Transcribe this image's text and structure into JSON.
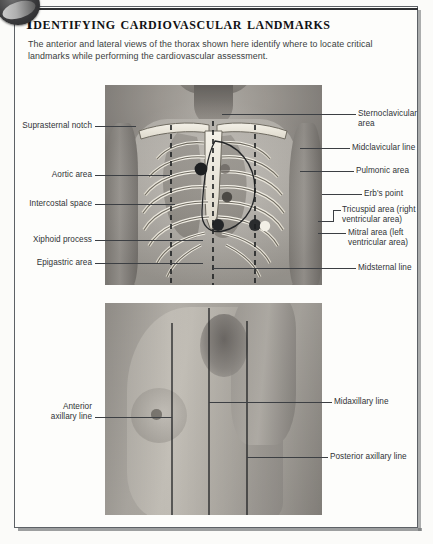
{
  "page": {
    "title": "Identifying cardiovascular landmarks",
    "intro": "The anterior and lateral views of the thorax shown here identify where to locate critical landmarks while performing the cardiovascular assessment.",
    "badge_icon": "dark-circular-badge-icon"
  },
  "anterior_view": {
    "name": "anterior-thorax-photo",
    "left_labels": [
      {
        "id": "suprasternal-notch",
        "text": "Suprasternal notch"
      },
      {
        "id": "aortic-area",
        "text": "Aortic area"
      },
      {
        "id": "intercostal-space",
        "text": "Intercostal space"
      },
      {
        "id": "xiphoid-process",
        "text": "Xiphoid process"
      },
      {
        "id": "epigastric-area",
        "text": "Epigastric area"
      }
    ],
    "right_labels": [
      {
        "id": "sternoclavicular-area",
        "text": "Sternoclavicular\narea"
      },
      {
        "id": "midclavicular-line",
        "text": "Midclavicular line"
      },
      {
        "id": "pulmonic-area",
        "text": "Pulmonic area"
      },
      {
        "id": "erbs-point",
        "text": "Erb's point"
      },
      {
        "id": "tricuspid-area",
        "text": "Tricuspid area (right\nventricular area)"
      },
      {
        "id": "mitral-area",
        "text": "Mitral area (left\nventricular area)"
      },
      {
        "id": "midsternal-line",
        "text": "Midsternal line"
      }
    ]
  },
  "lateral_view": {
    "name": "lateral-thorax-photo",
    "left_labels": [
      {
        "id": "anterior-axillary-line",
        "text": "Anterior\naxillary line"
      }
    ],
    "right_labels": [
      {
        "id": "midaxillary-line",
        "text": "Midaxillary line"
      },
      {
        "id": "posterior-axillary-line",
        "text": "Posterior axillary line"
      }
    ]
  },
  "colors": {
    "ink": "#303336",
    "rule": "#2e3033",
    "leader": "#3c3f43",
    "frame": "#5d6166",
    "paper": "#fdfdfb"
  }
}
